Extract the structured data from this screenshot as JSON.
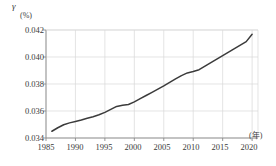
{
  "chart_data": {
    "type": "line",
    "title": "",
    "subtitle": "",
    "ylabel": "γ",
    "yunit": "(%)",
    "xlabel": "",
    "xunit": "(年)",
    "xlim": [
      1985,
      2021
    ],
    "ylim": [
      0.034,
      0.042
    ],
    "grid": true,
    "legend": null,
    "ytick_labels": [
      "0.042",
      "0.040",
      "0.038",
      "0.036",
      "0.034"
    ],
    "ytick_values": [
      0.042,
      0.04,
      0.038,
      0.036,
      0.034
    ],
    "xtick_labels": [
      "1985",
      "1990",
      "1995",
      "2000",
      "2005",
      "2010",
      "2015",
      "2020"
    ],
    "xtick_values": [
      1985,
      1990,
      1995,
      2000,
      2005,
      2010,
      2015,
      2020
    ],
    "series": [
      {
        "name": "γ",
        "color": "#3b3b3b",
        "x": [
          1986,
          1987,
          1988,
          1989,
          1990,
          1991,
          1992,
          1993,
          1994,
          1995,
          1996,
          1997,
          1998,
          1999,
          2000,
          2001,
          2002,
          2003,
          2004,
          2005,
          2006,
          2007,
          2008,
          2009,
          2010,
          2011,
          2012,
          2013,
          2014,
          2015,
          2016,
          2017,
          2018,
          2019,
          2020
        ],
        "values": [
          0.0345,
          0.03476,
          0.03498,
          0.03512,
          0.03522,
          0.03533,
          0.03546,
          0.03558,
          0.03572,
          0.0359,
          0.03612,
          0.03634,
          0.03642,
          0.03648,
          0.03668,
          0.03692,
          0.03715,
          0.03738,
          0.03762,
          0.03786,
          0.03812,
          0.03838,
          0.03862,
          0.03882,
          0.03892,
          0.03906,
          0.03932,
          0.03958,
          0.03984,
          0.0401,
          0.04036,
          0.04062,
          0.04088,
          0.04114,
          0.04168
        ]
      }
    ]
  },
  "colors": {
    "line": "#3b3b3b",
    "grid": "#d8d8d8",
    "axis": "#8a8a8a",
    "text": "#3a3a3a",
    "background": "#ffffff"
  }
}
